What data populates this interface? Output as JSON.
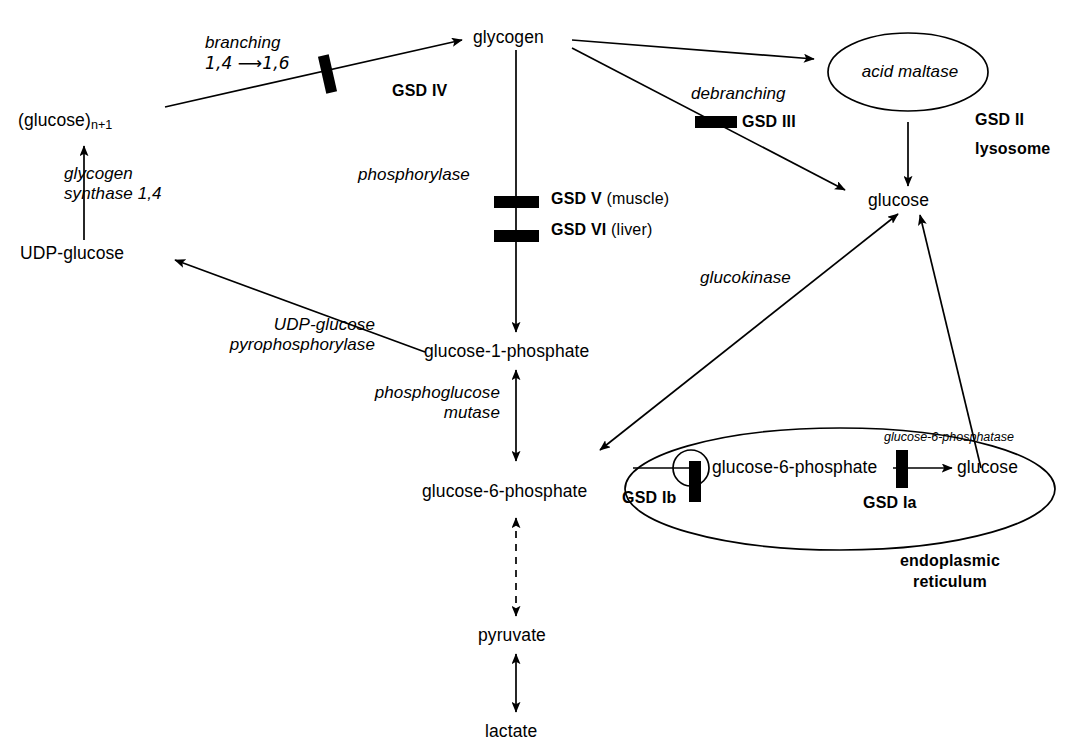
{
  "figure": {
    "type": "biochemical-pathway-diagram"
  },
  "metabolites": {
    "glucose_n1": "(glucose)",
    "glucose_n1_sub": "n+1",
    "udp_glucose": "UDP-glucose",
    "glycogen": "glycogen",
    "glucose_1_phosphate": "glucose-1-phosphate",
    "glucose_6_phosphate": "glucose-6-phosphate",
    "pyruvate": "pyruvate",
    "lactate": "lactate",
    "glucose_cytosol": "glucose",
    "glucose_6_phosphate_er": "glucose-6-phosphate",
    "glucose_er": "glucose"
  },
  "enzymes": {
    "branching_l1": "branching",
    "branching_l2": "1,4 ⟶1,6",
    "glycogen_synthase_l1": "glycogen",
    "glycogen_synthase_l2": "synthase 1,4",
    "phosphorylase": "phosphorylase",
    "debranching": "debranching",
    "acid_maltase": "acid maltase",
    "udp_glucose_pyrophosphorylase_l1": "UDP-glucose",
    "udp_glucose_pyrophosphorylase_l2": "pyrophosphorylase",
    "phosphoglucose_mutase_l1": "phosphoglucose",
    "phosphoglucose_mutase_l2": "mutase",
    "glucokinase": "glucokinase",
    "glucose_6_phosphatase": "glucose-6-phosphatase"
  },
  "gsd_labels": {
    "gsd_iv": "GSD IV",
    "gsd_iii": "GSD III",
    "gsd_ii": "GSD II",
    "gsd_v_bold": "GSD V",
    "gsd_v_plain": "(muscle)",
    "gsd_vi_bold": "GSD VI",
    "gsd_vi_plain": "(liver)",
    "gsd_ia": "GSD Ia",
    "gsd_ib": "GSD Ib"
  },
  "organelles": {
    "lysosome": "lysosome",
    "endoplasmic_reticulum_l1": "endoplasmic",
    "endoplasmic_reticulum_l2": "reticulum"
  },
  "colors": {
    "stroke": "#000000",
    "background": "#ffffff",
    "block": "#000000"
  }
}
